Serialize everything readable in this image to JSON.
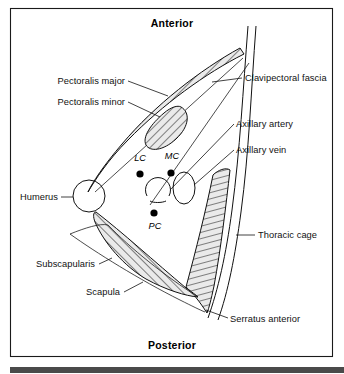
{
  "figure": {
    "orientation": {
      "top_label": "Anterior",
      "bottom_label": "Posterior"
    },
    "colors": {
      "ink": "#111111",
      "background": "#ffffff",
      "frame": "#1a1a1a",
      "hatch_fill": "#e8e8e8",
      "bottom_bar": "#4a4a4a",
      "marker": "#000000"
    },
    "labels": [
      {
        "id": "pectoralis-major",
        "text": "Pectoralis major",
        "align": "right",
        "x": 125,
        "y": 84
      },
      {
        "id": "pectoralis-minor",
        "text": "Pectoralis minor",
        "align": "right",
        "x": 125,
        "y": 105
      },
      {
        "id": "clavipectoral-fascia",
        "text": "Clavipectoral fascia",
        "align": "left",
        "x": 245,
        "y": 81
      },
      {
        "id": "axillary-artery",
        "text": "Axillary artery",
        "align": "left",
        "x": 236,
        "y": 127
      },
      {
        "id": "axillary-vein",
        "text": "Axillary vein",
        "align": "left",
        "x": 236,
        "y": 153
      },
      {
        "id": "humerus",
        "text": "Humerus",
        "align": "right",
        "x": 58,
        "y": 200
      },
      {
        "id": "thoracic-cage",
        "text": "Thoracic cage",
        "align": "left",
        "x": 258,
        "y": 238
      },
      {
        "id": "subscapularis",
        "text": "Subscapularis",
        "align": "right",
        "x": 95,
        "y": 267
      },
      {
        "id": "scapula",
        "text": "Scapula",
        "align": "right",
        "x": 120,
        "y": 295
      },
      {
        "id": "serratus-anterior",
        "text": "Serratus anterior",
        "align": "left",
        "x": 230,
        "y": 322
      }
    ],
    "cords": [
      {
        "id": "lateral-cord",
        "abbr": "LC",
        "label_x": 140,
        "label_y": 161,
        "dot_x": 140,
        "dot_y": 174
      },
      {
        "id": "medial-cord",
        "abbr": "MC",
        "label_x": 172,
        "label_y": 159,
        "dot_x": 171,
        "dot_y": 173
      },
      {
        "id": "posterior-cord",
        "abbr": "PC",
        "label_x": 155,
        "label_y": 229,
        "dot_x": 154,
        "dot_y": 213
      }
    ]
  }
}
